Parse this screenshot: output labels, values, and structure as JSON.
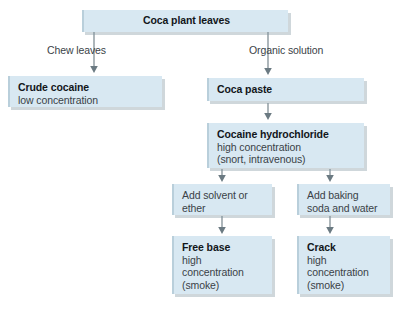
{
  "diagram": {
    "colors": {
      "box_fill": "#d8e8f2",
      "box_edge": "#b9cfdb",
      "shadow": "#8296a0",
      "connector": "#6b7a82",
      "title_text": "#12161a",
      "sub_text": "#3a4247",
      "background": "#ffffff"
    },
    "nodes": {
      "coca_plant_leaves": {
        "title": "Coca plant leaves",
        "sub": ""
      },
      "crude_cocaine": {
        "title": "Crude cocaine",
        "sub": "low concentration"
      },
      "coca_paste": {
        "title": "Coca paste",
        "sub": ""
      },
      "cocaine_hydrochloride": {
        "title": "Cocaine hydrochloride",
        "sub_line1": "high concentration",
        "sub_line2": "(snort, intravenous)"
      },
      "add_solvent": {
        "line1": "Add solvent or",
        "line2": "ether"
      },
      "add_baking_soda": {
        "line1": "Add baking",
        "line2": "soda and water"
      },
      "free_base": {
        "title": "Free base",
        "sub_line1": "high",
        "sub_line2": "concentration",
        "sub_line3": "(smoke)"
      },
      "crack": {
        "title": "Crack",
        "sub_line1": "high",
        "sub_line2": "concentration",
        "sub_line3": "(smoke)"
      }
    },
    "edge_labels": {
      "chew_leaves": "Chew leaves",
      "organic_solution": "Organic solution"
    }
  }
}
